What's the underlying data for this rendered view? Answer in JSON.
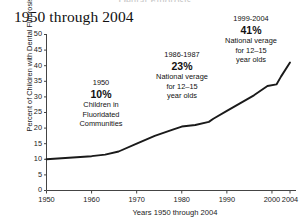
{
  "figure": {
    "clipped_headline": "Dental Fluorosis",
    "title": "1950 through 2004"
  },
  "chart_data": {
    "type": "line",
    "title": "1950 through 2004",
    "xlabel": "Years 1950 through 2004",
    "ylabel": "Percent of Children with Dental Fluorosis",
    "xlim": [
      1950,
      2004
    ],
    "ylim": [
      0,
      50
    ],
    "grid": false,
    "legend": "none",
    "xticks": [
      "1950",
      "1960",
      "1970",
      "1980",
      "1990",
      "2000",
      "2004"
    ],
    "xtick_values": [
      1950,
      1960,
      1970,
      1980,
      1990,
      2000,
      2004
    ],
    "yticks": [
      "0",
      "5",
      "10",
      "15",
      "20",
      "25",
      "30",
      "35",
      "40",
      "45",
      "50"
    ],
    "ytick_values": [
      0,
      5,
      10,
      15,
      20,
      25,
      30,
      35,
      40,
      45,
      50
    ],
    "series": [
      {
        "name": "Percent of children with dental fluorosis",
        "x": [
          1950,
          1955,
          1960,
          1963,
          1966,
          1970,
          1974,
          1978,
          1980,
          1983,
          1986,
          1987,
          1990,
          1993,
          1996,
          1999,
          2001,
          2002,
          2004
        ],
        "values": [
          10.0,
          10.5,
          11.0,
          11.5,
          12.5,
          15.0,
          17.5,
          19.5,
          20.5,
          21.0,
          22.0,
          23.0,
          25.5,
          28.0,
          30.5,
          33.5,
          34.0,
          36.5,
          41.0
        ]
      }
    ],
    "annotations": [
      {
        "id": "1950",
        "year": "1950",
        "percent": "10%",
        "lines": [
          "Children in",
          "Fluoridated",
          "Communities"
        ]
      },
      {
        "id": "1986-1987",
        "year": "1986-1987",
        "percent": "23%",
        "lines": [
          "National verage",
          "for 12–15",
          "year olds"
        ]
      },
      {
        "id": "1999-2004",
        "year": "1999-2004",
        "percent": "41%",
        "lines": [
          "National verage",
          "for 12–15",
          "year olds"
        ]
      }
    ],
    "colors": {
      "line": "#1a1a1a",
      "axis": "#444444",
      "text": "#111111",
      "background": "#ffffff"
    }
  }
}
